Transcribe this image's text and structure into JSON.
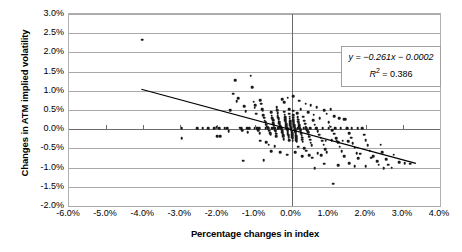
{
  "chart_data": {
    "type": "scatter",
    "title": "",
    "xlabel": "Percentage changes in index",
    "ylabel": "Changes in ATM implied volatility",
    "xlim": [
      -6.0,
      4.0
    ],
    "ylim": [
      -2.0,
      3.0
    ],
    "xticks": [
      "-6.0%",
      "-5.0%",
      "-4.0%",
      "-3.0%",
      "-2.0%",
      "-1.0%",
      "0.0%",
      "1.0%",
      "2.0%",
      "3.0%",
      "4.0%"
    ],
    "xtick_values": [
      -6.0,
      -5.0,
      -4.0,
      -3.0,
      -2.0,
      -1.0,
      0.0,
      1.0,
      2.0,
      3.0,
      4.0
    ],
    "yticks": [
      "3.0%",
      "2.5%",
      "2.0%",
      "1.5%",
      "1.0%",
      "0.5%",
      "0.0%",
      "-0.5%",
      "-1.0%",
      "-1.5%",
      "-2.0%"
    ],
    "ytick_values": [
      3.0,
      2.5,
      2.0,
      1.5,
      1.0,
      0.5,
      0.0,
      -0.5,
      -1.0,
      -1.5,
      -2.0
    ],
    "grid": true,
    "legend": "none",
    "annotation": {
      "equation": "y = −0.261x − 0.0002",
      "r_squared_label": "R",
      "r_squared_exp": "2",
      "r_squared_value": "= 0.386"
    },
    "trendline": {
      "slope": -0.261,
      "intercept": -0.0002,
      "r2": 0.386,
      "x_start": -4.05,
      "y_start": 1.04,
      "x_end": 3.35,
      "y_end": -0.89
    },
    "marker": {
      "shape": "circle",
      "color": "#1a1a1a",
      "size": 2.6
    },
    "points": [
      [
        -4.02,
        2.33
      ],
      [
        -2.96,
        0.02
      ],
      [
        -2.96,
        -0.24
      ],
      [
        -2.25,
        0.03
      ],
      [
        -2.08,
        0.02
      ],
      [
        -2.02,
        0.05
      ],
      [
        -2.0,
        -0.18
      ],
      [
        -1.93,
        -0.19
      ],
      [
        -1.8,
        0.02
      ],
      [
        -1.74,
        0.02
      ],
      [
        -1.7,
        -0.05
      ],
      [
        -1.66,
        0.5
      ],
      [
        -1.58,
        0.92
      ],
      [
        -1.52,
        1.27
      ],
      [
        -1.48,
        0.73
      ],
      [
        -1.44,
        0.8
      ],
      [
        -1.4,
        0.04
      ],
      [
        -1.36,
        0.03
      ],
      [
        -1.33,
        -0.03
      ],
      [
        -1.28,
        0.6
      ],
      [
        -1.24,
        0.47
      ],
      [
        -1.2,
        0.02
      ],
      [
        -1.18,
        -0.08
      ],
      [
        -1.14,
        0.02
      ],
      [
        -1.1,
        1.39
      ],
      [
        -1.06,
        1.1
      ],
      [
        -1.02,
        0.72
      ],
      [
        -1.0,
        0.56
      ],
      [
        -0.98,
        0.62
      ],
      [
        -0.96,
        0.4
      ],
      [
        -0.94,
        0.04
      ],
      [
        -0.92,
        0.02
      ],
      [
        -0.9,
        -0.02
      ],
      [
        -0.88,
        0.03
      ],
      [
        -0.86,
        -0.1
      ],
      [
        -0.84,
        0.75
      ],
      [
        -0.82,
        0.66
      ],
      [
        -0.8,
        0.52
      ],
      [
        -0.78,
        0.48
      ],
      [
        -0.76,
        0.36
      ],
      [
        -0.74,
        0.3
      ],
      [
        -0.72,
        0.22
      ],
      [
        -0.7,
        0.18
      ],
      [
        -0.68,
        0.12
      ],
      [
        -0.66,
        0.06
      ],
      [
        -0.64,
        0.02
      ],
      [
        -0.62,
        0.02
      ],
      [
        -0.6,
        -0.04
      ],
      [
        -0.58,
        -0.1
      ],
      [
        -0.56,
        -0.14
      ],
      [
        -0.55,
        0.44
      ],
      [
        -0.54,
        0.35
      ],
      [
        -0.52,
        0.28
      ],
      [
        -0.5,
        0.24
      ],
      [
        -0.49,
        0.16
      ],
      [
        -0.48,
        0.1
      ],
      [
        -0.47,
        0.04
      ],
      [
        -0.46,
        0.02
      ],
      [
        -0.45,
        0.02
      ],
      [
        -0.44,
        -0.02
      ],
      [
        -0.43,
        -0.06
      ],
      [
        -0.42,
        -0.12
      ],
      [
        -0.41,
        -0.18
      ],
      [
        -0.4,
        0.58
      ],
      [
        -0.39,
        0.5
      ],
      [
        -0.38,
        0.42
      ],
      [
        -0.37,
        0.34
      ],
      [
        -0.36,
        0.3
      ],
      [
        -0.35,
        0.26
      ],
      [
        -0.34,
        0.2
      ],
      [
        -0.33,
        0.16
      ],
      [
        -0.32,
        0.12
      ],
      [
        -0.31,
        0.08
      ],
      [
        -0.3,
        0.04
      ],
      [
        -0.29,
        0.02
      ],
      [
        -0.28,
        0.02
      ],
      [
        -0.27,
        0.0
      ],
      [
        -0.26,
        -0.04
      ],
      [
        -0.25,
        -0.08
      ],
      [
        -0.24,
        -0.12
      ],
      [
        -0.23,
        -0.16
      ],
      [
        -0.22,
        -0.2
      ],
      [
        -0.21,
        -0.26
      ],
      [
        -0.2,
        0.7
      ],
      [
        -0.2,
        0.46
      ],
      [
        -0.19,
        0.38
      ],
      [
        -0.18,
        0.32
      ],
      [
        -0.17,
        0.26
      ],
      [
        -0.17,
        0.22
      ],
      [
        -0.16,
        0.18
      ],
      [
        -0.15,
        0.14
      ],
      [
        -0.15,
        0.1
      ],
      [
        -0.14,
        0.06
      ],
      [
        -0.13,
        0.04
      ],
      [
        -0.13,
        0.02
      ],
      [
        -0.12,
        0.02
      ],
      [
        -0.12,
        0.0
      ],
      [
        -0.11,
        -0.02
      ],
      [
        -0.1,
        -0.06
      ],
      [
        -0.1,
        -0.1
      ],
      [
        -0.09,
        -0.14
      ],
      [
        -0.08,
        -0.18
      ],
      [
        -0.08,
        -0.22
      ],
      [
        -0.07,
        -0.28
      ],
      [
        -0.06,
        0.52
      ],
      [
        -0.06,
        0.4
      ],
      [
        -0.05,
        0.33
      ],
      [
        -0.05,
        0.27
      ],
      [
        -0.04,
        0.21
      ],
      [
        -0.04,
        0.17
      ],
      [
        -0.03,
        0.13
      ],
      [
        -0.03,
        0.09
      ],
      [
        -0.02,
        0.05
      ],
      [
        -0.02,
        0.03
      ],
      [
        -0.01,
        0.02
      ],
      [
        -0.01,
        0.0
      ],
      [
        0.0,
        -0.02
      ],
      [
        0.0,
        -0.05
      ],
      [
        0.01,
        -0.09
      ],
      [
        0.01,
        -0.13
      ],
      [
        0.02,
        -0.17
      ],
      [
        0.02,
        -0.21
      ],
      [
        0.03,
        -0.25
      ],
      [
        0.03,
        -0.3
      ],
      [
        0.04,
        0.48
      ],
      [
        0.04,
        0.36
      ],
      [
        0.05,
        0.3
      ],
      [
        0.05,
        0.24
      ],
      [
        0.06,
        0.19
      ],
      [
        0.06,
        0.15
      ],
      [
        0.07,
        0.11
      ],
      [
        0.07,
        0.07
      ],
      [
        0.08,
        0.04
      ],
      [
        0.08,
        0.02
      ],
      [
        0.09,
        0.01
      ],
      [
        0.09,
        -0.01
      ],
      [
        0.1,
        -0.04
      ],
      [
        0.1,
        -0.07
      ],
      [
        0.11,
        -0.11
      ],
      [
        0.11,
        -0.15
      ],
      [
        0.12,
        -0.19
      ],
      [
        0.12,
        -0.23
      ],
      [
        0.13,
        -0.28
      ],
      [
        0.14,
        -0.33
      ],
      [
        0.15,
        0.42
      ],
      [
        0.16,
        0.32
      ],
      [
        0.17,
        0.25
      ],
      [
        0.18,
        0.2
      ],
      [
        0.19,
        0.15
      ],
      [
        0.2,
        0.1
      ],
      [
        0.21,
        0.05
      ],
      [
        0.22,
        0.02
      ],
      [
        0.23,
        0.0
      ],
      [
        0.24,
        -0.03
      ],
      [
        0.25,
        -0.07
      ],
      [
        0.26,
        -0.12
      ],
      [
        0.27,
        -0.17
      ],
      [
        0.28,
        -0.22
      ],
      [
        0.29,
        -0.27
      ],
      [
        0.3,
        -0.33
      ],
      [
        0.32,
        0.33
      ],
      [
        0.34,
        0.22
      ],
      [
        0.36,
        0.14
      ],
      [
        0.38,
        0.06
      ],
      [
        0.4,
        0.02
      ],
      [
        0.42,
        -0.02
      ],
      [
        0.44,
        -0.08
      ],
      [
        0.46,
        -0.14
      ],
      [
        0.48,
        -0.2
      ],
      [
        0.5,
        -0.27
      ],
      [
        0.52,
        -0.35
      ],
      [
        0.54,
        -0.42
      ],
      [
        0.58,
        0.24
      ],
      [
        0.62,
        0.12
      ],
      [
        0.66,
        0.03
      ],
      [
        0.7,
        -0.05
      ],
      [
        0.74,
        -0.14
      ],
      [
        0.78,
        -0.22
      ],
      [
        0.82,
        -0.3
      ],
      [
        0.86,
        -0.4
      ],
      [
        0.9,
        -0.52
      ],
      [
        0.95,
        -0.6
      ],
      [
        1.0,
        0.18
      ],
      [
        1.05,
        0.06
      ],
      [
        1.1,
        -0.02
      ],
      [
        1.15,
        -0.12
      ],
      [
        1.2,
        -0.24
      ],
      [
        1.25,
        -0.34
      ],
      [
        1.3,
        -0.46
      ],
      [
        1.35,
        -0.58
      ],
      [
        1.4,
        0.26
      ],
      [
        1.45,
        0.26
      ],
      [
        1.5,
        0.02
      ],
      [
        1.55,
        -0.1
      ],
      [
        1.6,
        -0.22
      ],
      [
        1.65,
        -0.36
      ],
      [
        1.7,
        -0.48
      ],
      [
        1.75,
        -0.62
      ],
      [
        1.8,
        -0.76
      ],
      [
        1.9,
        0.02
      ],
      [
        1.95,
        -0.14
      ],
      [
        2.0,
        -0.28
      ],
      [
        2.05,
        -0.42
      ],
      [
        2.1,
        -0.56
      ],
      [
        2.2,
        -0.7
      ],
      [
        2.3,
        -0.84
      ],
      [
        2.4,
        -0.4
      ],
      [
        2.45,
        -0.6
      ],
      [
        2.55,
        -0.78
      ],
      [
        2.6,
        -0.92
      ],
      [
        2.75,
        -0.66
      ],
      [
        2.9,
        -0.86
      ],
      [
        3.05,
        -0.88
      ],
      [
        3.2,
        -0.9
      ],
      [
        -1.95,
        0.02
      ],
      [
        -1.3,
        -0.82
      ],
      [
        -0.75,
        -0.8
      ],
      [
        0.55,
        -0.74
      ],
      [
        0.62,
        -1.02
      ],
      [
        0.7,
        -0.62
      ],
      [
        0.88,
        -0.9
      ],
      [
        1.12,
        -1.42
      ],
      [
        1.25,
        -0.94
      ],
      [
        1.42,
        -0.7
      ],
      [
        1.55,
        -0.88
      ],
      [
        1.7,
        -0.96
      ],
      [
        1.85,
        -0.64
      ],
      [
        2.0,
        -0.96
      ],
      [
        2.15,
        -0.74
      ],
      [
        2.35,
        -0.92
      ],
      [
        2.48,
        -1.02
      ],
      [
        2.7,
        -1.0
      ],
      [
        -0.55,
        -0.58
      ],
      [
        -0.3,
        -0.6
      ],
      [
        -0.12,
        -0.66
      ],
      [
        0.1,
        -0.6
      ],
      [
        0.28,
        -0.7
      ],
      [
        0.4,
        -0.56
      ],
      [
        0.18,
        -0.46
      ],
      [
        0.34,
        -0.5
      ],
      [
        -0.45,
        -0.44
      ],
      [
        -0.62,
        -0.4
      ],
      [
        0.48,
        -0.68
      ],
      [
        0.8,
        -0.68
      ],
      [
        -2.55,
        0.03
      ],
      [
        -2.4,
        0.02
      ],
      [
        -0.98,
        0.02
      ],
      [
        -0.7,
        0.02
      ],
      [
        -0.52,
        0.02
      ],
      [
        -0.36,
        0.02
      ],
      [
        0.16,
        0.02
      ],
      [
        0.33,
        0.02
      ],
      [
        0.5,
        0.02
      ],
      [
        0.68,
        0.02
      ],
      [
        0.84,
        0.02
      ],
      [
        1.0,
        0.02
      ],
      [
        1.18,
        0.02
      ],
      [
        1.32,
        0.02
      ],
      [
        1.48,
        0.02
      ],
      [
        1.62,
        0.02
      ],
      [
        1.78,
        0.02
      ],
      [
        -0.85,
        -0.3
      ],
      [
        -0.68,
        -0.34
      ],
      [
        0.92,
        -0.3
      ],
      [
        1.08,
        -0.28
      ],
      [
        1.22,
        -0.3
      ],
      [
        1.38,
        -0.3
      ],
      [
        1.52,
        -0.32
      ],
      [
        0.25,
        0.52
      ],
      [
        0.45,
        0.44
      ],
      [
        0.6,
        0.38
      ],
      [
        0.76,
        0.28
      ],
      [
        0.95,
        0.4
      ],
      [
        1.05,
        0.52
      ],
      [
        1.15,
        0.34
      ],
      [
        1.28,
        0.28
      ],
      [
        -0.25,
        0.78
      ],
      [
        -0.1,
        0.82
      ],
      [
        0.05,
        0.86
      ],
      [
        0.2,
        0.74
      ],
      [
        0.38,
        0.66
      ],
      [
        0.52,
        0.62
      ],
      [
        0.68,
        0.58
      ],
      [
        0.88,
        0.5
      ]
    ]
  }
}
